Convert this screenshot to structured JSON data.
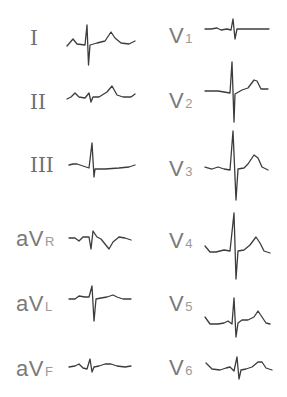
{
  "figure": {
    "stroke_color": "#3c3c3c",
    "label_color": "#7a7a7a",
    "limb_leads": [
      {
        "id": "I",
        "label": "I",
        "sub": ""
      },
      {
        "id": "II",
        "label": "II",
        "sub": ""
      },
      {
        "id": "III",
        "label": "III",
        "sub": ""
      },
      {
        "id": "aVR",
        "label": "aV",
        "sub": "R"
      },
      {
        "id": "aVL",
        "label": "aV",
        "sub": "L"
      },
      {
        "id": "aVF",
        "label": "aV",
        "sub": "F"
      }
    ],
    "precordial_leads": [
      {
        "id": "V1",
        "label": "V",
        "sub": "1"
      },
      {
        "id": "V2",
        "label": "V",
        "sub": "2"
      },
      {
        "id": "V3",
        "label": "V",
        "sub": "3"
      },
      {
        "id": "V4",
        "label": "V",
        "sub": "4"
      },
      {
        "id": "V5",
        "label": "V",
        "sub": "5"
      },
      {
        "id": "V6",
        "label": "V",
        "sub": "6"
      }
    ]
  }
}
